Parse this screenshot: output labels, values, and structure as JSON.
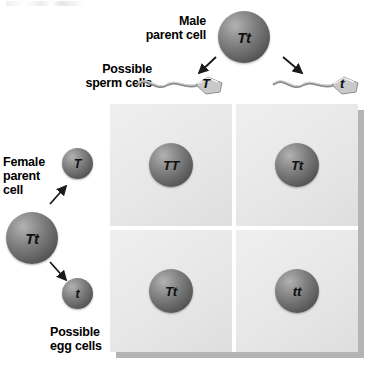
{
  "figure": {
    "background_color": "#ffffff"
  },
  "labels": {
    "male_parent": "Male\nparent cell",
    "possible_sperm": "Possible\nsperm cells",
    "female_parent": "Female\nparent\ncell",
    "possible_egg": "Possible\negg cells"
  },
  "parents": {
    "male": {
      "genotype": "Tt"
    },
    "female": {
      "genotype": "Tt"
    }
  },
  "gametes": {
    "sperm": [
      {
        "allele": "T"
      },
      {
        "allele": "t"
      }
    ],
    "eggs": [
      {
        "allele": "T"
      },
      {
        "allele": "t"
      }
    ]
  },
  "punnett_square": {
    "rows": 2,
    "columns": 2,
    "cells": [
      {
        "genotype": "TT",
        "row": 0,
        "column": 0
      },
      {
        "genotype": "Tt",
        "row": 0,
        "column": 1
      },
      {
        "genotype": "Tt",
        "row": 1,
        "column": 0
      },
      {
        "genotype": "tt",
        "row": 1,
        "column": 1
      }
    ],
    "cell_color": "#e9e9e9",
    "shadow_color": "#b4b4b4"
  },
  "colors": {
    "sphere_light": "#b2b2b2",
    "sphere_dark": "#434343",
    "text": "#000000"
  }
}
